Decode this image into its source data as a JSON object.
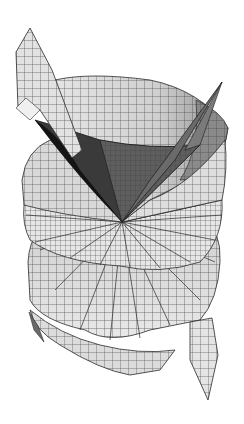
{
  "figure": {
    "background": "#ffffff",
    "center_point": [
      122,
      222
    ],
    "colors": {
      "light_face": "#e2e2e2",
      "mid_face": "#c8c8c8",
      "shade_face": "#9a9a9a",
      "dark_face": "#5a5a5a",
      "darkest_face": "#1c1c1c",
      "edge": "#2a2a2a"
    }
  }
}
